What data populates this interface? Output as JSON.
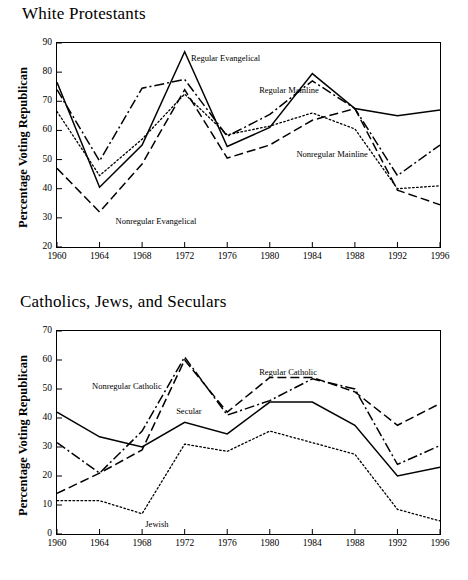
{
  "figure": {
    "panels": [
      {
        "id": "white-protestants",
        "title": "White Protestants",
        "ylabel": "Percentage Voting Republican"
      },
      {
        "id": "catholics-jews-seculars",
        "title": "Catholics, Jews, and Seculars",
        "ylabel": "Percentage Voting Republican"
      }
    ],
    "caption": ""
  },
  "chart_data": [
    {
      "type": "line",
      "title": "White Protestants",
      "xlabel": "",
      "ylabel": "Percentage Voting Republican",
      "x": [
        1960,
        1964,
        1968,
        1972,
        1976,
        1980,
        1984,
        1988,
        1992,
        1996
      ],
      "xtick_labels": [
        "1960",
        "1964",
        "1968",
        "1972",
        "1976",
        "1980",
        "1984",
        "1988",
        "1992",
        "1996"
      ],
      "ylim": [
        20,
        90
      ],
      "ytick_labels": [
        "20",
        "30",
        "40",
        "50",
        "60",
        "70",
        "80",
        "90"
      ],
      "yticks": [
        20,
        30,
        40,
        50,
        60,
        70,
        80,
        90
      ],
      "xlim": [
        1960,
        1996
      ],
      "grid": false,
      "legend": "inline-annotations",
      "series": [
        {
          "name": "Regular Evangelical",
          "style": "solid",
          "label_x": 1972.6,
          "label_y": 85,
          "values": [
            76.5,
            40.5,
            55.0,
            87.0,
            54.5,
            61.0,
            79.5,
            67.5,
            65.0,
            67.0
          ]
        },
        {
          "name": "Regular Mainline",
          "style": "dashdot",
          "label_x": 1979.0,
          "label_y": 74,
          "values": [
            74.0,
            49.5,
            74.5,
            77.5,
            58.0,
            65.5,
            77.0,
            67.5,
            44.5,
            55.0
          ]
        },
        {
          "name": "Nonregular Mainline",
          "style": "dotted",
          "label_x": 1982.5,
          "label_y": 52,
          "values": [
            66.5,
            44.5,
            57.0,
            72.5,
            58.5,
            61.5,
            66.0,
            60.5,
            40.0,
            41.0
          ]
        },
        {
          "name": "Nonregular Evangelical",
          "style": "dashed",
          "label_x": 1965.5,
          "label_y": 29,
          "values": [
            47.0,
            32.0,
            48.5,
            74.0,
            50.5,
            55.0,
            63.5,
            67.5,
            39.5,
            34.5
          ]
        }
      ]
    },
    {
      "type": "line",
      "title": "Catholics, Jews, and Seculars",
      "xlabel": "",
      "ylabel": "Percentage Voting Republican",
      "x": [
        1960,
        1964,
        1968,
        1972,
        1976,
        1980,
        1984,
        1988,
        1992,
        1996
      ],
      "xtick_labels": [
        "1960",
        "1964",
        "1968",
        "1972",
        "1976",
        "1980",
        "1984",
        "1988",
        "1992",
        "1996"
      ],
      "ylim": [
        0,
        70
      ],
      "ytick_labels": [
        "0",
        "10",
        "20",
        "30",
        "40",
        "50",
        "60",
        "70"
      ],
      "yticks": [
        0,
        10,
        20,
        30,
        40,
        50,
        60,
        70
      ],
      "xlim": [
        1960,
        1996
      ],
      "grid": false,
      "legend": "inline-annotations",
      "series": [
        {
          "name": "Regular Catholic",
          "style": "dashed",
          "label_x": 1979.0,
          "label_y": 56,
          "values": [
            14.0,
            21.0,
            29.0,
            60.0,
            42.0,
            54.0,
            54.0,
            49.0,
            37.5,
            45.0
          ]
        },
        {
          "name": "Nonregular Catholic",
          "style": "dashdot",
          "label_x": 1963.3,
          "label_y": 51,
          "values": [
            31.5,
            21.0,
            35.5,
            61.0,
            41.0,
            46.0,
            53.5,
            50.0,
            24.0,
            30.5
          ]
        },
        {
          "name": "Secular",
          "style": "solid",
          "label_x": 1971.2,
          "label_y": 42.5,
          "values": [
            42.0,
            33.5,
            30.0,
            38.5,
            34.5,
            45.5,
            45.5,
            37.5,
            20.0,
            23.0
          ]
        },
        {
          "name": "Jewish",
          "style": "dotted",
          "label_x": 1968.3,
          "label_y": 3.5,
          "values": [
            11.5,
            11.5,
            7.0,
            31.0,
            28.5,
            35.5,
            31.5,
            27.5,
            8.5,
            4.5
          ]
        }
      ]
    }
  ]
}
